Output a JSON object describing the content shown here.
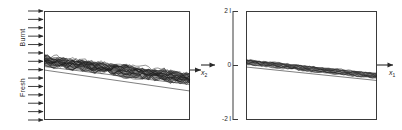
{
  "figure": {
    "background_color": "#ffffff",
    "line_color": "#2a2a2a",
    "band_color": "#1a1a1a",
    "box_color": "#3a3a3a"
  },
  "left_panel": {
    "name": "turbulent-flame-panel",
    "side_labels": {
      "top": "Burnt",
      "bottom": "Fresh"
    },
    "inflow_arrows": {
      "count": 14,
      "direction": "right"
    },
    "outflow_arrow": {
      "direction": "right"
    },
    "box": {
      "x": 44,
      "y": 11,
      "width": 146,
      "height": 109
    },
    "flame_band": {
      "type": "wrinkled-band",
      "description": "thick wrinkled turbulent flame brush sloping downward to the right",
      "left_y": 61,
      "right_y": 79,
      "left_thickness": 9,
      "right_thickness": 11,
      "wrinkle_amplitude": 2.2,
      "wrinkle_count": 46
    },
    "guide_lines": [
      {
        "name": "upper-edge-line",
        "x1": 44,
        "y1": 58.0,
        "x2": 190,
        "y2": 74.5
      },
      {
        "name": "mid-edge-line",
        "x1": 44,
        "y1": 66.5,
        "x2": 190,
        "y2": 84.5
      },
      {
        "name": "lower-edge-line",
        "x1": 44,
        "y1": 70.0,
        "x2": 190,
        "y2": 91.0
      }
    ]
  },
  "right_panel": {
    "name": "laminar-flame-panel",
    "box": {
      "x": 45,
      "y": 11,
      "width": 131,
      "height": 109
    },
    "y_axis": {
      "name": "x2-axis",
      "label": "x",
      "label_sub": "2",
      "ticks": [
        {
          "value": "2 l",
          "y": 11
        },
        {
          "value": "0",
          "y": 65
        },
        {
          "value": "-2 l",
          "y": 119
        }
      ]
    },
    "x_axis": {
      "name": "x1-axis",
      "label": "x",
      "label_sub": "1"
    },
    "flame_band": {
      "type": "thin-band",
      "description": "thin nearly-straight flame band sloping downward to the right",
      "left_y": 62,
      "right_y": 76,
      "thickness": 4.5,
      "wrinkle_amplitude": 0.7,
      "wrinkle_count": 60
    },
    "guide_lines": [
      {
        "name": "upper-edge-line",
        "x1": 45,
        "y1": 60.5,
        "x2": 176,
        "y2": 73.5
      },
      {
        "name": "lower-edge-line",
        "x1": 45,
        "y1": 67.0,
        "x2": 176,
        "y2": 80.5
      }
    ]
  },
  "connector_arrow": {
    "name": "panel-connector-arrow",
    "direction": "right"
  }
}
